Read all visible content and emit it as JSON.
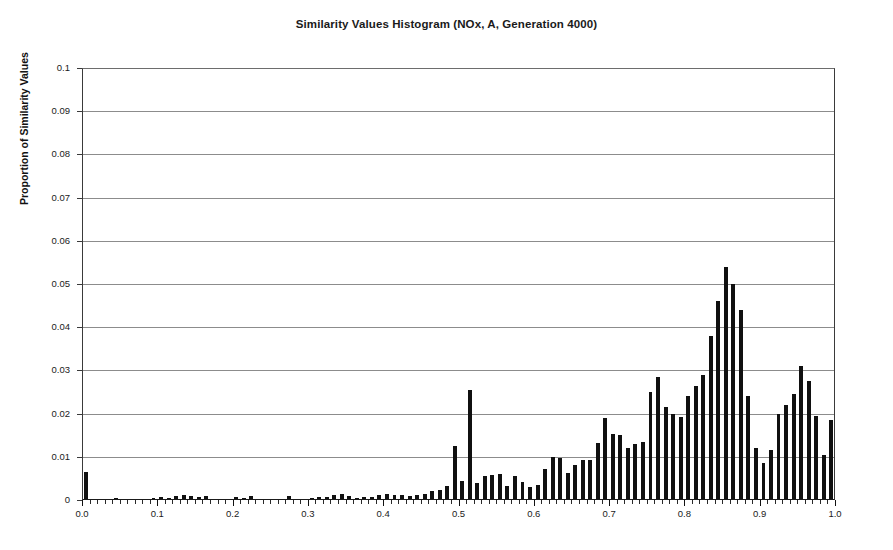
{
  "chart_data": {
    "type": "bar",
    "title": "Similarity Values Histogram (NOx, A, Generation 4000)",
    "xlabel": "",
    "ylabel": "Proportion of Similarity Values",
    "xlim": [
      0.0,
      1.0
    ],
    "ylim": [
      0,
      0.1
    ],
    "grid": true,
    "legend": null,
    "bin_width": 0.01,
    "ytick_labels": [
      "0.1",
      "0.09",
      "0.08",
      "0.07",
      "0.06",
      "0.05",
      "0.04",
      "0.03",
      "0.02",
      "0.01",
      "0"
    ],
    "ytick_values": [
      0.1,
      0.09,
      0.08,
      0.07,
      0.06,
      0.05,
      0.04,
      0.03,
      0.02,
      0.01,
      0
    ],
    "xtick_labels": [
      "0.0",
      "0.1",
      "0.2",
      "0.3",
      "0.4",
      "0.5",
      "0.6",
      "0.7",
      "0.8",
      "0.9",
      "1.0"
    ],
    "xtick_values": [
      0.0,
      0.1,
      0.2,
      0.3,
      0.4,
      0.5,
      0.6,
      0.7,
      0.8,
      0.9,
      1.0
    ],
    "x": [
      0.0,
      0.01,
      0.02,
      0.03,
      0.04,
      0.05,
      0.06,
      0.07,
      0.08,
      0.09,
      0.1,
      0.11,
      0.12,
      0.13,
      0.14,
      0.15,
      0.16,
      0.17,
      0.18,
      0.19,
      0.2,
      0.21,
      0.22,
      0.23,
      0.24,
      0.25,
      0.26,
      0.27,
      0.28,
      0.29,
      0.3,
      0.31,
      0.32,
      0.33,
      0.34,
      0.35,
      0.36,
      0.37,
      0.38,
      0.39,
      0.4,
      0.41,
      0.42,
      0.43,
      0.44,
      0.45,
      0.46,
      0.47,
      0.48,
      0.49,
      0.5,
      0.51,
      0.52,
      0.53,
      0.54,
      0.55,
      0.56,
      0.57,
      0.58,
      0.59,
      0.6,
      0.61,
      0.62,
      0.63,
      0.64,
      0.65,
      0.66,
      0.67,
      0.68,
      0.69,
      0.7,
      0.71,
      0.72,
      0.73,
      0.74,
      0.75,
      0.76,
      0.77,
      0.78,
      0.79,
      0.8,
      0.81,
      0.82,
      0.83,
      0.84,
      0.85,
      0.86,
      0.87,
      0.88,
      0.89,
      0.9,
      0.91,
      0.92,
      0.93,
      0.94,
      0.95,
      0.96,
      0.97,
      0.98,
      0.99
    ],
    "values": [
      0.0065,
      0.0002,
      0.0001,
      0.0002,
      0.0005,
      0.0002,
      0.0002,
      0.0003,
      0.0002,
      0.0004,
      0.0006,
      0.0004,
      0.0009,
      0.0011,
      0.001,
      0.0006,
      0.0009,
      0.0003,
      0.0003,
      0.0002,
      0.0007,
      0.0004,
      0.0009,
      0.0002,
      0.0002,
      0.0003,
      0.0003,
      0.001,
      0.0002,
      0.0003,
      0.0005,
      0.0006,
      0.0008,
      0.0012,
      0.0013,
      0.001,
      0.0005,
      0.0006,
      0.0008,
      0.0012,
      0.0013,
      0.0011,
      0.0011,
      0.0009,
      0.0012,
      0.0015,
      0.002,
      0.0024,
      0.0033,
      0.0125,
      0.0045,
      0.0255,
      0.004,
      0.0055,
      0.0058,
      0.006,
      0.0032,
      0.0055,
      0.0042,
      0.003,
      0.0035,
      0.0072,
      0.01,
      0.0098,
      0.0062,
      0.008,
      0.0092,
      0.0093,
      0.0133,
      0.019,
      0.0152,
      0.015,
      0.012,
      0.013,
      0.0135,
      0.025,
      0.0285,
      0.0215,
      0.02,
      0.0192,
      0.024,
      0.0265,
      0.029,
      0.038,
      0.046,
      0.054,
      0.05,
      0.044,
      0.024,
      0.012,
      0.0085,
      0.0115,
      0.02,
      0.022,
      0.0245,
      0.031,
      0.0275,
      0.0195,
      0.0105,
      0.0185
    ]
  }
}
